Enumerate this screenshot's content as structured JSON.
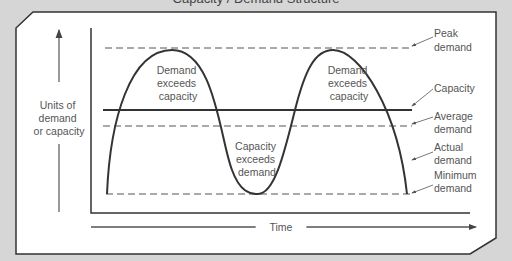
{
  "caption_partial": "Capacity / Demand Structure",
  "axes": {
    "y_label": [
      "Units of",
      "demand",
      "or capacity"
    ],
    "x_label": "Time"
  },
  "regions": [
    {
      "id": "peak1",
      "text": [
        "Demand",
        "exceeds",
        "capacity"
      ]
    },
    {
      "id": "trough",
      "text": [
        "Capacity",
        "exceeds",
        "demand"
      ]
    },
    {
      "id": "peak2",
      "text": [
        "Demand",
        "exceeds",
        "capacity"
      ]
    }
  ],
  "callouts": [
    {
      "id": "peak-demand",
      "text": [
        "Peak",
        "demand"
      ]
    },
    {
      "id": "capacity",
      "text": [
        "Capacity"
      ]
    },
    {
      "id": "average-demand",
      "text": [
        "Average",
        "demand"
      ]
    },
    {
      "id": "actual-demand",
      "text": [
        "Actual",
        "demand"
      ]
    },
    {
      "id": "minimum-demand",
      "text": [
        "Minimum",
        "demand"
      ]
    }
  ],
  "colors": {
    "background": "#d6d6d6",
    "panel": "#ffffff",
    "line": "#3a3a3a",
    "text": "#555555"
  }
}
